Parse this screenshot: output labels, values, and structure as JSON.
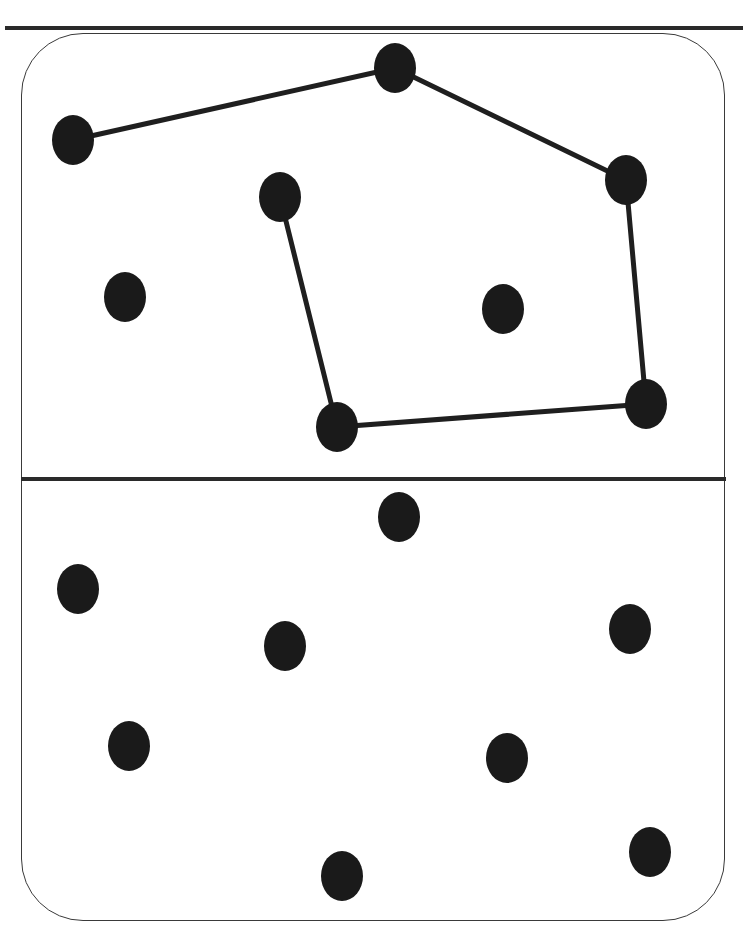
{
  "diagram": {
    "colors": {
      "dot": "#1a1a1a",
      "edge": "#1f1f1f",
      "frame": "#3a3a3a",
      "rule": "#2a2a2a",
      "background": "#ffffff"
    },
    "dot_radius": {
      "rx": 21,
      "ry": 25
    },
    "top_panel": {
      "dots": [
        {
          "id": "A",
          "x": 73,
          "y": 140
        },
        {
          "id": "B",
          "x": 395,
          "y": 68
        },
        {
          "id": "C",
          "x": 280,
          "y": 197
        },
        {
          "id": "D",
          "x": 626,
          "y": 180
        },
        {
          "id": "G",
          "x": 125,
          "y": 297
        },
        {
          "id": "E",
          "x": 503,
          "y": 309
        },
        {
          "id": "F",
          "x": 646,
          "y": 404
        },
        {
          "id": "H",
          "x": 337,
          "y": 427
        }
      ],
      "path": [
        "A",
        "B",
        "D",
        "F",
        "H",
        "C"
      ]
    },
    "bottom_panel": {
      "dots": [
        {
          "id": "A",
          "x": 78,
          "y": 589
        },
        {
          "id": "B",
          "x": 399,
          "y": 517
        },
        {
          "id": "C",
          "x": 285,
          "y": 646
        },
        {
          "id": "D",
          "x": 630,
          "y": 629
        },
        {
          "id": "G",
          "x": 129,
          "y": 746
        },
        {
          "id": "E",
          "x": 507,
          "y": 758
        },
        {
          "id": "F",
          "x": 650,
          "y": 852
        },
        {
          "id": "H",
          "x": 342,
          "y": 876
        }
      ],
      "path": []
    }
  }
}
